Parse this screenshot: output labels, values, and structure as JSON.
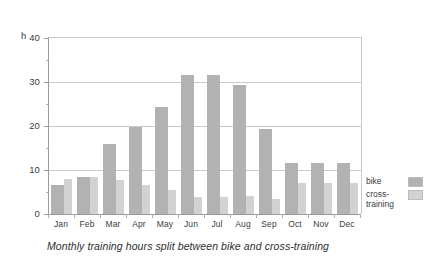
{
  "chart_data": {
    "type": "bar",
    "title": "",
    "caption": "Monthly training hours split between bike and cross-training",
    "xlabel": "",
    "ylabel": "h",
    "ylim": [
      0,
      40
    ],
    "yticks": [
      0,
      10,
      20,
      30,
      40
    ],
    "ytick_labels": [
      "0",
      "10",
      "20",
      "30",
      "40"
    ],
    "y_unit_label": "h",
    "grid": true,
    "grid_axis": "y",
    "legend_position": "right",
    "categories": [
      "Jan",
      "Feb",
      "Mar",
      "Apr",
      "May",
      "Jun",
      "Jul",
      "Aug",
      "Sep",
      "Oct",
      "Nov",
      "Dec"
    ],
    "series": [
      {
        "name": "bike",
        "color": "#b2b2b2",
        "values": [
          6.5,
          8.5,
          15.8,
          19.8,
          24.3,
          31.5,
          31.5,
          29.3,
          19.3,
          11.5,
          11.5,
          11.5
        ]
      },
      {
        "name": "cross-training",
        "color": "#d2d2d2",
        "values": [
          8.0,
          8.5,
          7.8,
          6.5,
          5.5,
          3.8,
          3.8,
          4.0,
          3.5,
          7.0,
          7.0,
          7.0
        ]
      }
    ]
  },
  "legend": {
    "items": [
      {
        "label": "bike",
        "color": "#b2b2b2"
      },
      {
        "label": "cross-training",
        "color": "#d2d2d2"
      }
    ]
  }
}
